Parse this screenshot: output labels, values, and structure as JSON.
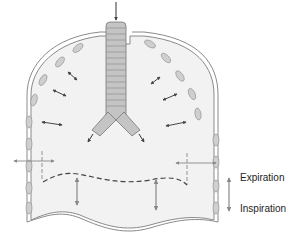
{
  "diagram": {
    "type": "anatomical-diagram",
    "legend": {
      "up_label": "Expiration",
      "down_label": "Inspiration"
    },
    "colors": {
      "cavity_fill": "#f2f2f2",
      "outline": "#7a7a7a",
      "rib_segment": "#c8c8c8",
      "trachea": "#bfbfbf",
      "arrow": "#555555",
      "dashed_line": "#444444"
    }
  }
}
